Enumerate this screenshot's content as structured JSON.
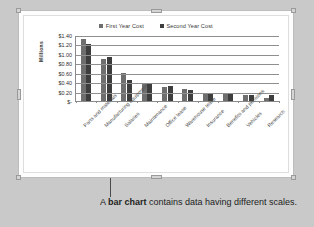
{
  "caption": {
    "before": "A ",
    "emphasis": "bar chart",
    "after": " contains data having different scales."
  },
  "colors": {
    "series_first": "#6e6e6e",
    "series_second": "#3d3d3d",
    "page_background": "#c9c9c9",
    "chart_background": "#ffffff",
    "gridline": "#8f8f8f",
    "axis": "#8a8a8a"
  },
  "chart_object": {
    "selected": true,
    "handles": [
      "top-left",
      "top-middle",
      "top-right",
      "left-middle",
      "right-middle",
      "bottom-left",
      "bottom-middle",
      "bottom-right"
    ]
  },
  "chart_data": {
    "type": "bar",
    "title": "",
    "xlabel": "",
    "ylabel": "Millions",
    "ylim": [
      0,
      1.4
    ],
    "grid": true,
    "legend_position": "top",
    "ytick_labels": [
      "$1.40",
      "$1.20",
      "$1.00",
      "$0.80",
      "$0.60",
      "$0.40",
      "$0.20",
      "$-"
    ],
    "ytick_values": [
      1.4,
      1.2,
      1.0,
      0.8,
      0.6,
      0.4,
      0.2,
      0.0
    ],
    "categories": [
      "Parts and materials",
      "Manufacturing equipment",
      "Salaries",
      "Maintenance",
      "Office lease",
      "Warehouse lease",
      "Insurance",
      "Benefits and pensions",
      "Vehicles",
      "Research"
    ],
    "series": [
      {
        "name": "First Year Cost",
        "color": "#6e6e6e",
        "values": [
          1.32,
          0.9,
          0.6,
          0.37,
          0.29,
          0.25,
          0.18,
          0.14,
          0.12,
          0.06
        ]
      },
      {
        "name": "Second Year Cost",
        "color": "#3d3d3d",
        "values": [
          1.22,
          0.94,
          0.45,
          0.36,
          0.32,
          0.24,
          0.17,
          0.17,
          0.13,
          0.12
        ]
      }
    ]
  }
}
